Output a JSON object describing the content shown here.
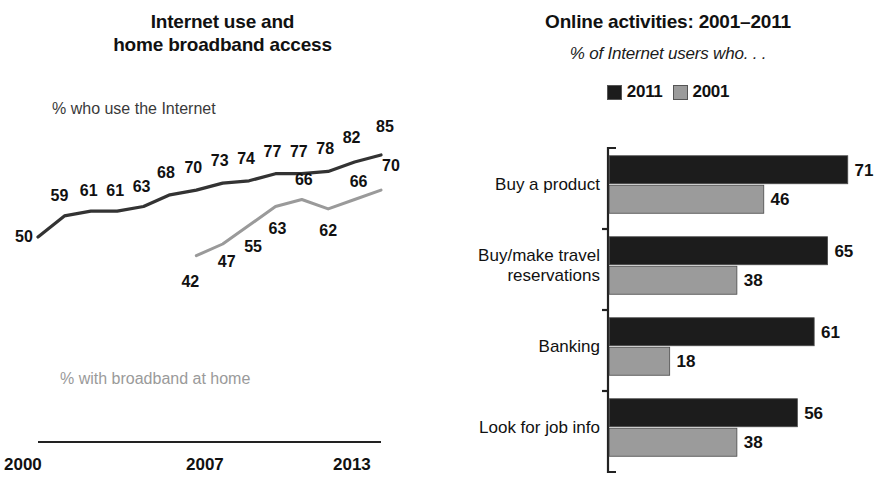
{
  "chart_data": [
    {
      "type": "line",
      "title": "Internet use and home broadband access",
      "title_line1": "Internet use and",
      "title_line2": "home broadband access",
      "xlabel": "",
      "ylabel": "",
      "grid": false,
      "legend_position": "inline-labels",
      "x": [
        2000,
        2001,
        2002,
        2003,
        2004,
        2005,
        2006,
        2007,
        2008,
        2009,
        2010,
        2011,
        2012,
        2013
      ],
      "xtick_labels": [
        "2000",
        "2007",
        "2013"
      ],
      "xlim": [
        2000,
        2013
      ],
      "ylim": [
        0,
        100
      ],
      "series": [
        {
          "name": "% who use the Internet",
          "color": "#333333",
          "label_color": "#3a3a3a",
          "values": [
            50,
            59,
            61,
            61,
            63,
            68,
            70,
            73,
            74,
            77,
            77,
            78,
            82,
            85
          ],
          "point_labels": [
            "50",
            "59",
            "61",
            "61",
            "63",
            "68",
            "70",
            "73",
            "74",
            "77",
            "77",
            "78",
            "82",
            "85"
          ]
        },
        {
          "name": "% with broadband at home",
          "color": "#9a9a9a",
          "label_color": "#9a9a9a",
          "x": [
            2006,
            2007,
            2008,
            2009,
            2010,
            2011,
            2012,
            2013
          ],
          "values": [
            42,
            47,
            55,
            63,
            66,
            62,
            66,
            70
          ],
          "point_labels": [
            "42",
            "47",
            "55",
            "63",
            "66",
            "62",
            "66",
            "70"
          ]
        }
      ]
    },
    {
      "type": "bar",
      "orientation": "horizontal",
      "title": "Online activities: 2001–2011",
      "subtitle": "% of Internet users who. . .",
      "xlabel": "",
      "ylabel": "",
      "grid": false,
      "legend_position": "top-center",
      "xlim": [
        0,
        80
      ],
      "categories": [
        "Buy a product",
        "Buy/make travel reservations",
        "Banking",
        "Look for job info"
      ],
      "category_lines": [
        [
          "Buy a product"
        ],
        [
          "Buy/make travel",
          "reservations"
        ],
        [
          "Banking"
        ],
        [
          "Look for job info"
        ]
      ],
      "series": [
        {
          "name": "2011",
          "color": "#1c1c1c",
          "values": [
            71,
            65,
            61,
            56
          ]
        },
        {
          "name": "2001",
          "color": "#9b9b9b",
          "values": [
            46,
            38,
            18,
            38
          ]
        }
      ]
    }
  ],
  "left_panel": {
    "title_line1": "Internet use and",
    "title_line2": "home broadband access",
    "internet_label": "% who use the Internet",
    "broadband_label": "% with broadband at home",
    "xticks": [
      "2000",
      "2007",
      "2013"
    ]
  },
  "right_panel": {
    "title": "Online activities: 2001–2011",
    "subtitle": "% of Internet users who. . .",
    "legend": [
      {
        "label": "2011",
        "color": "#1c1c1c"
      },
      {
        "label": "2001",
        "color": "#9b9b9b"
      }
    ]
  },
  "colors": {
    "internet_line": "#333333",
    "broadband_line": "#9a9a9a",
    "bar_2011": "#1c1c1c",
    "bar_2001": "#9b9b9b",
    "text": "#111111",
    "axis": "#222222",
    "background": "#ffffff"
  }
}
